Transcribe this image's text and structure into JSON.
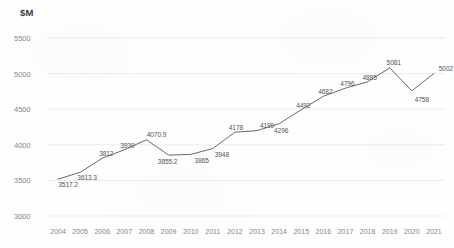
{
  "chart_data": {
    "type": "line",
    "title": "",
    "ylabel": "$M",
    "xlabel": "",
    "categories": [
      "2004",
      "2005",
      "2006",
      "2007",
      "2008",
      "2009",
      "2010",
      "2011",
      "2012",
      "2013",
      "2014",
      "2015",
      "2016",
      "2017",
      "2018",
      "2019",
      "2020",
      "2021"
    ],
    "values": [
      3517.2,
      3613.3,
      3812,
      3930,
      4070.9,
      3855.2,
      3865,
      3948,
      4178,
      4199,
      4296,
      4492,
      4682,
      4796,
      4885,
      5081,
      4758,
      5002
    ],
    "point_labels": [
      "3517.2",
      "3613.3",
      "3812",
      "3930",
      "4070.9",
      "3855.2",
      "3865",
      "3948",
      "4178",
      "4199",
      "4296",
      "4492",
      "4682",
      "4796",
      "4885",
      "5081",
      "4758",
      "5002"
    ],
    "ylim": [
      3000,
      5500
    ],
    "yticks": [
      3000,
      3500,
      4000,
      4500,
      5000,
      5500
    ],
    "ytick_labels": [
      "3000",
      "3500",
      "4000",
      "4500",
      "5000",
      "5500"
    ],
    "grid": true,
    "legend": "none",
    "series_color": "#595959",
    "grid_color": "#e6e6e6",
    "tick_text_color": "#868686",
    "label_text_color": "#555555"
  }
}
